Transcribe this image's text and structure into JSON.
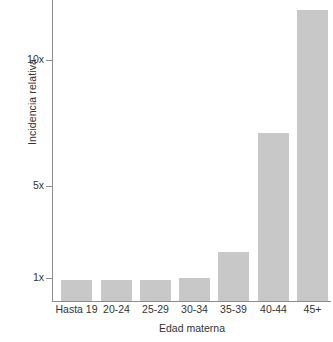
{
  "chart_data": {
    "type": "bar",
    "title": "",
    "subtitle": "",
    "xlabel": "Edad materna",
    "ylabel": "Incidencia relativa",
    "categories": [
      "Hasta 19",
      "20-24",
      "25-29",
      "30-34",
      "35-39",
      "40-44",
      "45+"
    ],
    "values": [
      1,
      1,
      1,
      1.05,
      1.7,
      7,
      12.5
    ],
    "value_labels": [
      "1x",
      "1x",
      "1x",
      "1x",
      "1.7x",
      "7x",
      "12.5x"
    ],
    "ytick_labels": [
      "1x",
      "5x",
      "10x"
    ],
    "ytick_values": [
      1,
      5,
      10
    ],
    "ylim": [
      0,
      13.2
    ],
    "yscale": "custom-compressed",
    "grid": false,
    "legend": false,
    "legend_position": "none",
    "bar_color": "#c8c8c8",
    "axis_color": "#8c8c8c",
    "text_color": "#333333",
    "background_color": "#ffffff",
    "annotations": []
  },
  "axes": {
    "y": {
      "title": "Incidencia relativa",
      "ticks": [
        {
          "label": "10x",
          "y": 60
        },
        {
          "label": "5x",
          "y": 186
        },
        {
          "label": "1x",
          "y": 278
        }
      ]
    },
    "x": {
      "title": "Edad materna",
      "ticks": [
        {
          "label": "Hasta 19"
        },
        {
          "label": "20-24"
        },
        {
          "label": "25-29"
        },
        {
          "label": "30-34"
        },
        {
          "label": "35-39"
        },
        {
          "label": "40-44"
        },
        {
          "label": "45+"
        }
      ]
    }
  },
  "bars": [
    {
      "category": "Hasta 19",
      "value": 1,
      "top": 280,
      "left": 8,
      "width": 31
    },
    {
      "category": "20-24",
      "value": 1,
      "top": 280,
      "left": 48,
      "width": 31
    },
    {
      "category": "25-29",
      "value": 1,
      "top": 280,
      "left": 87,
      "width": 31
    },
    {
      "category": "30-34",
      "value": 1.05,
      "top": 278,
      "left": 126,
      "width": 31
    },
    {
      "category": "35-39",
      "value": 1.7,
      "top": 252,
      "left": 165,
      "width": 31
    },
    {
      "category": "40-44",
      "value": 7,
      "top": 133,
      "left": 205,
      "width": 31
    },
    {
      "category": "45+",
      "value": 12.5,
      "top": 10,
      "left": 244,
      "width": 31
    }
  ]
}
